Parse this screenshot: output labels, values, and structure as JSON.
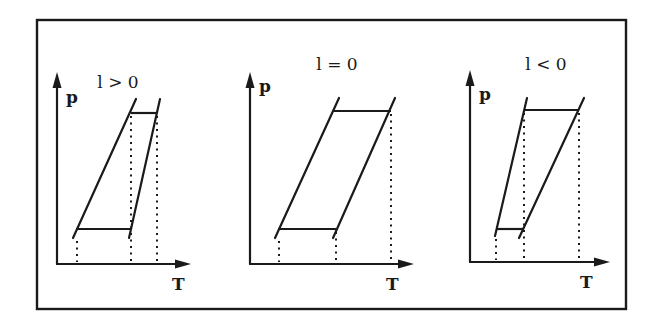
{
  "figure": {
    "frame": {
      "x": 37,
      "y": 20,
      "width": 589,
      "height": 289
    },
    "colors": {
      "ink": "#1a1a1a",
      "background": "#ffffff"
    },
    "panels": [
      {
        "title": "l > 0",
        "y_label": "p",
        "x_label": "T",
        "axes": {
          "origin_x": 57,
          "origin_y": 264,
          "y_top": 72,
          "x_right": 191
        },
        "title_pos": {
          "x": 118,
          "y": 88
        },
        "y_label_pos": {
          "x": 66,
          "y": 103
        },
        "x_label_pos": {
          "x": 172,
          "y": 290
        },
        "line_left": {
          "x1": 73,
          "y1": 238,
          "x2": 136,
          "y2": 99
        },
        "line_right": {
          "x1": 129,
          "y1": 238,
          "x2": 160,
          "y2": 99
        },
        "h_bottom": {
          "x1": 76,
          "x2": 130,
          "y": 229
        },
        "h_top": {
          "x1": 131,
          "x2": 157,
          "y": 113
        },
        "dotted_x": [
          77,
          131,
          157
        ],
        "dotted_top_y": [
          238,
          113,
          113
        ]
      },
      {
        "title": "l = 0",
        "y_label": "p",
        "x_label": "T",
        "axes": {
          "origin_x": 250,
          "origin_y": 264,
          "y_top": 72,
          "x_right": 414
        },
        "title_pos": {
          "x": 337,
          "y": 70
        },
        "y_label_pos": {
          "x": 259,
          "y": 92
        },
        "x_label_pos": {
          "x": 386,
          "y": 290
        },
        "line_left": {
          "x1": 275,
          "y1": 238,
          "x2": 339,
          "y2": 98
        },
        "line_right": {
          "x1": 333,
          "y1": 238,
          "x2": 395,
          "y2": 98
        },
        "h_bottom": {
          "x1": 278,
          "x2": 336,
          "y": 229
        },
        "h_top": {
          "x1": 334,
          "x2": 391,
          "y": 111
        },
        "dotted_x": [
          279,
          336,
          391
        ],
        "dotted_top_y": [
          238,
          229,
          111
        ]
      },
      {
        "title": "l < 0",
        "y_label": "p",
        "x_label": "T",
        "axes": {
          "origin_x": 470,
          "origin_y": 262,
          "y_top": 70,
          "x_right": 610
        },
        "title_pos": {
          "x": 546,
          "y": 70
        },
        "y_label_pos": {
          "x": 479,
          "y": 100
        },
        "x_label_pos": {
          "x": 580,
          "y": 288
        },
        "line_left": {
          "x1": 495,
          "y1": 236,
          "x2": 527,
          "y2": 98
        },
        "line_right": {
          "x1": 519,
          "y1": 238,
          "x2": 584,
          "y2": 98
        },
        "h_bottom": {
          "x1": 497,
          "x2": 524,
          "y": 229
        },
        "h_top": {
          "x1": 524,
          "x2": 578,
          "y": 110
        },
        "dotted_x": [
          496,
          524,
          579
        ],
        "dotted_top_y": [
          236,
          110,
          110
        ]
      }
    ]
  }
}
